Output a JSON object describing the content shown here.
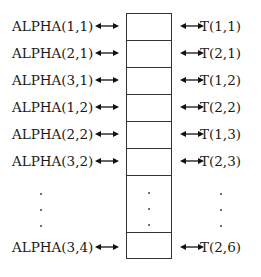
{
  "diagram": {
    "left_labels": [
      "ALPHA(1,1)",
      "ALPHA(2,1)",
      "ALPHA(3,1)",
      "ALPHA(1,2)",
      "ALPHA(2,2)",
      "ALPHA(3,2)",
      "ALPHA(3,4)"
    ],
    "right_labels": [
      "T(1,1)",
      "T(2,1)",
      "T(1,2)",
      "T(2,2)",
      "T(1,3)",
      "T(2,3)",
      "T(2,6)"
    ],
    "connector": "double-headed-arrow",
    "ellipsis": "vertical-dots"
  }
}
